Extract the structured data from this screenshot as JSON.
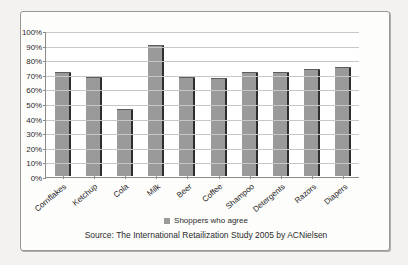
{
  "chart_data": {
    "type": "bar",
    "title": "",
    "subtitle": "",
    "xlabel": "",
    "ylabel": "",
    "ylim": [
      0,
      100
    ],
    "y_unit": "%",
    "grid": true,
    "legend_position": "bottom",
    "categories": [
      "Cornflakes",
      "Ketchup",
      "Cola",
      "Milk",
      "Beer",
      "Coffee",
      "Shampoo",
      "Detergents",
      "Razors",
      "Diapers"
    ],
    "series": [
      {
        "name": "Shoppers who agree",
        "color": "#9a9a9a",
        "values": [
          71,
          68,
          46,
          90,
          68,
          67,
          71,
          71,
          73,
          75
        ]
      }
    ],
    "y_ticks": [
      "0%",
      "10%",
      "20%",
      "30%",
      "40%",
      "50%",
      "60%",
      "70%",
      "80%",
      "90%",
      "100%"
    ],
    "annotations": [
      "Source: The International Retailization Study 2005 by ACNielsen"
    ]
  },
  "legend": {
    "label": "Shoppers who agree",
    "swatch_color": "#9a9a9a"
  },
  "source": {
    "text": "Source: The International Retailization Study 2005 by ACNielsen"
  },
  "colors": {
    "bar": "#9a9a9a",
    "bar_edge": "#2e2e2e",
    "gridline": "#c9c7c4",
    "axis": "#8d8b88",
    "page_background": "#f3f2f0",
    "plot_background": "#ffffff"
  }
}
